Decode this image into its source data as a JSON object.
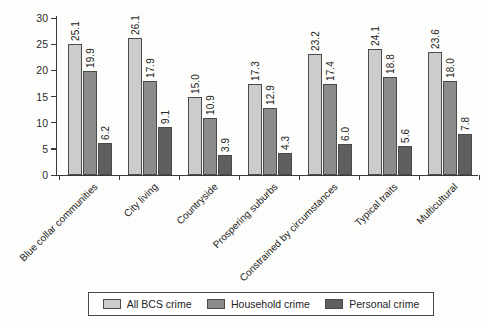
{
  "chart_data": {
    "type": "bar",
    "title": "",
    "subtitle": "",
    "xlabel": "",
    "ylabel": "",
    "ylim": [
      0,
      30
    ],
    "yticks": [
      0,
      5,
      10,
      15,
      20,
      25,
      30
    ],
    "grid": false,
    "legend_position": "bottom",
    "categories": [
      "Blue collar communities",
      "City living",
      "Countryside",
      "Prospering suburbs",
      "Constrained by circumstances",
      "Typical traits",
      "Multicultural"
    ],
    "series": [
      {
        "name": "All BCS crime",
        "color": "#cccccc",
        "values": [
          25.1,
          26.1,
          15.0,
          17.3,
          23.2,
          24.1,
          23.6
        ],
        "labels": [
          "25.1",
          "26.1",
          "15.0",
          "17.3",
          "23.2",
          "24.1",
          "23.6"
        ]
      },
      {
        "name": "Household crime",
        "color": "#8b8b8b",
        "values": [
          19.9,
          17.9,
          10.9,
          12.9,
          17.4,
          18.8,
          18.0
        ],
        "labels": [
          "19.9",
          "17.9",
          "10.9",
          "12.9",
          "17.4",
          "18.8",
          "18.0"
        ]
      },
      {
        "name": "Personal crime",
        "color": "#5f5f5f",
        "values": [
          6.2,
          9.1,
          3.9,
          4.3,
          6.0,
          5.6,
          7.8
        ],
        "labels": [
          "6.2",
          "9.1",
          "3.9",
          "4.3",
          "6.0",
          "5.6",
          "7.8"
        ]
      }
    ]
  },
  "axis": {
    "y_tick_labels": [
      "0",
      "5",
      "10",
      "15",
      "20",
      "25",
      "30"
    ]
  },
  "legend": {
    "items": [
      {
        "label": "All BCS crime"
      },
      {
        "label": "Household crime"
      },
      {
        "label": "Personal crime"
      }
    ]
  }
}
